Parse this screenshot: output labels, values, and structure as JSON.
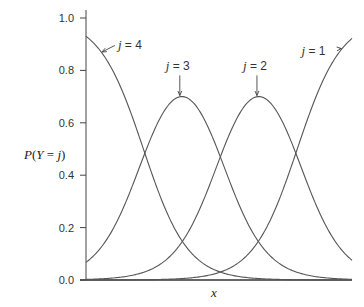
{
  "chart_data": {
    "type": "line",
    "title": "",
    "xlabel": "x",
    "ylabel": "P(Y = j)",
    "ylim": [
      0.0,
      1.0
    ],
    "yticks": [
      0.0,
      0.2,
      0.4,
      0.6,
      0.8,
      1.0
    ],
    "ytick_labels": [
      "0.0",
      "0.2",
      "0.4",
      "0.6",
      "0.8",
      "1.0"
    ],
    "xticks": [],
    "grid": false,
    "legend": null,
    "x": [
      0.0,
      0.1,
      0.2,
      0.3,
      0.4,
      0.5,
      0.6,
      0.7,
      0.8,
      0.9,
      1.0
    ],
    "series": [
      {
        "name": "j = 4",
        "values": [
          0.93,
          0.8,
          0.55,
          0.27,
          0.1,
          0.03,
          0.01,
          0.003,
          0.001,
          0.0,
          0.0
        ]
      },
      {
        "name": "j = 3",
        "values": [
          0.068,
          0.19,
          0.43,
          0.65,
          0.68,
          0.48,
          0.23,
          0.085,
          0.027,
          0.009,
          0.003
        ]
      },
      {
        "name": "j = 2",
        "values": [
          0.002,
          0.008,
          0.024,
          0.076,
          0.21,
          0.46,
          0.67,
          0.67,
          0.46,
          0.21,
          0.075
        ]
      },
      {
        "name": "j = 1",
        "values": [
          0.0,
          0.0,
          0.001,
          0.003,
          0.009,
          0.03,
          0.09,
          0.24,
          0.52,
          0.78,
          0.92
        ]
      }
    ],
    "model": {
      "kind": "cumulative-logit",
      "slope": 12.0,
      "thresholds": {
        "ge4": 2.59,
        "ge3": 6.06,
        "ge2": 9.53
      }
    },
    "annotations": [
      {
        "text": "j = 4",
        "series": "j = 4",
        "label_x": 0.12,
        "label_y": 0.88,
        "point_x": 0.06,
        "arrow": "diagonal"
      },
      {
        "text": "j = 3",
        "series": "j = 3",
        "label_x": 0.3,
        "label_y": 0.8,
        "point_x": 0.36,
        "arrow": "down"
      },
      {
        "text": "j = 2",
        "series": "j = 2",
        "label_x": 0.59,
        "label_y": 0.8,
        "point_x": 0.653,
        "arrow": "down"
      },
      {
        "text": "j = 1",
        "series": "j = 1",
        "label_x": 0.81,
        "label_y": 0.86,
        "point_x": 0.96,
        "arrow": "diagonal"
      }
    ]
  }
}
